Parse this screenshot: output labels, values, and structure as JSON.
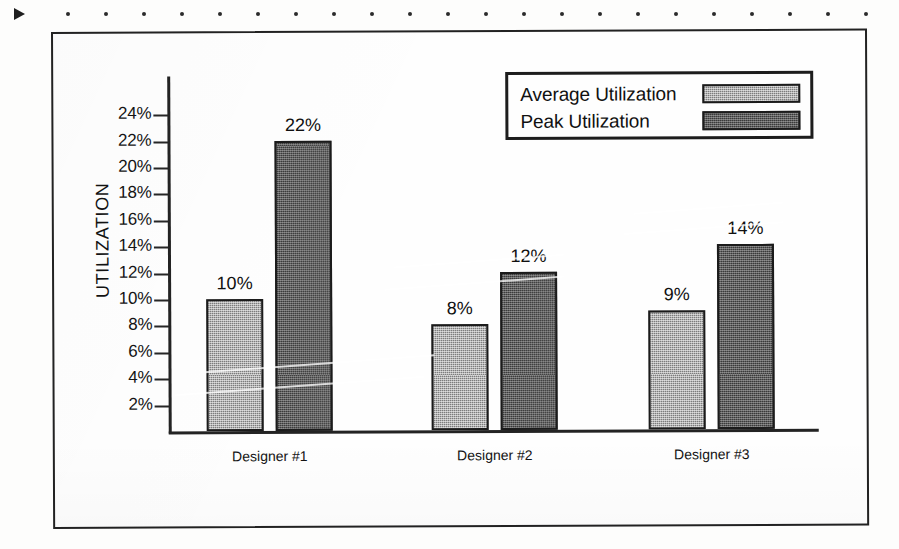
{
  "artifacts": {
    "arrow_marker": "triangle-marker",
    "dot_count": 22
  },
  "chart_data": {
    "type": "bar",
    "title": "",
    "xlabel": "",
    "ylabel": "UTILIZATION",
    "categories": [
      "Designer #1",
      "Designer #2",
      "Designer #3"
    ],
    "series": [
      {
        "name": "Average Utilization",
        "values": [
          10,
          8,
          9
        ],
        "labels": [
          "10%",
          "8%",
          "9%"
        ],
        "color": "#b2b2b2"
      },
      {
        "name": "Peak Utilization",
        "values": [
          22,
          12,
          14
        ],
        "labels": [
          "22%",
          "12%",
          "14%"
        ],
        "color": "#5d5d5d"
      }
    ],
    "ylim": [
      0,
      25
    ],
    "ytick_values": [
      2,
      4,
      6,
      8,
      10,
      12,
      14,
      16,
      18,
      20,
      22,
      24
    ],
    "ytick_labels": [
      "2%",
      "4%",
      "6%",
      "8%",
      "10%",
      "12%",
      "14%",
      "16%",
      "18%",
      "20%",
      "22%",
      "24%"
    ],
    "grid": false,
    "legend_position": "top-right"
  },
  "legend": {
    "rows": [
      {
        "label": "Average Utilization",
        "swatch": "avg"
      },
      {
        "label": "Peak Utilization",
        "swatch": "peak"
      }
    ]
  }
}
